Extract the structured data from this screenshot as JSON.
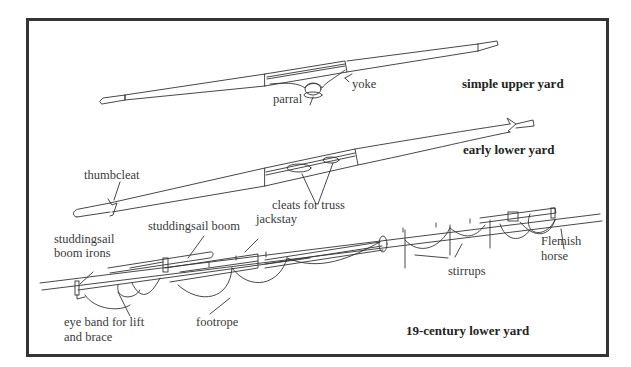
{
  "diagram": {
    "frame": {
      "border_color": "#333333"
    },
    "yards": [
      {
        "id": "simple-upper-yard",
        "title": "simple upper yard",
        "labels": [
          "parral",
          "yoke"
        ]
      },
      {
        "id": "early-lower-yard",
        "title": "early lower yard",
        "labels": [
          "thumbcleat",
          "cleats for truss"
        ]
      },
      {
        "id": "nineteenth-century-lower-yard",
        "title": "19-century lower yard",
        "labels": [
          "studdingsail",
          "boom irons",
          "studdingsail boom",
          "jackstay",
          "Flemish",
          "horse",
          "stirrups",
          "eye band for lift",
          "and brace",
          "footrope"
        ]
      }
    ]
  }
}
